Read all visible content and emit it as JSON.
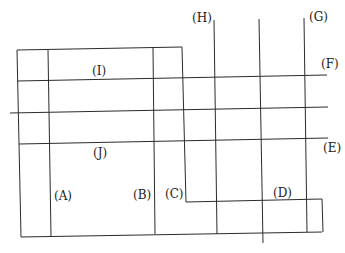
{
  "diagram": {
    "type": "line-grid-figure",
    "labels": {
      "A": "(A)",
      "B": "(B)",
      "C": "(C)",
      "D": "(D)",
      "E": "(E)",
      "F": "(F)",
      "G": "(G)",
      "H": "(H)",
      "I": "(I)",
      "J": "(J)"
    },
    "colors": {
      "line": "#2b2b2b",
      "text": "#222222",
      "background": "#ffffff"
    }
  }
}
